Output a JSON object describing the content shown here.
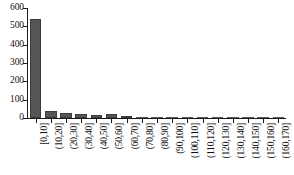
{
  "chart_data": {
    "type": "bar",
    "title": "",
    "subtitle": "",
    "xlabel": "",
    "ylabel": "",
    "ylim": [
      0,
      600
    ],
    "yticks": [
      0,
      100,
      200,
      300,
      400,
      500,
      600
    ],
    "ytick_labels": [
      "0",
      "100",
      "200",
      "300",
      "400",
      "500",
      "600"
    ],
    "grid": false,
    "legend": false,
    "legend_position": "none",
    "bar_color": "#565656",
    "bar_edge_color": "#3a3a3a",
    "axis_color": "#1a1a1a",
    "background_color": "#ffffff",
    "categories": [
      "[0,10]",
      "(10,20]",
      "(20,30]",
      "(30,40]",
      "(40,50]",
      "(50,60]",
      "(60,70]",
      "(70,80]",
      "(80,90]",
      "(90,100]",
      "(100,110]",
      "(110,120]",
      "(120,130]",
      "(130,140]",
      "(140,150]",
      "(150,160]",
      "(160,170]"
    ],
    "values": [
      540,
      40,
      25,
      20,
      16,
      20,
      11,
      2,
      1,
      1,
      2,
      2,
      1,
      1,
      1,
      1,
      1
    ]
  }
}
